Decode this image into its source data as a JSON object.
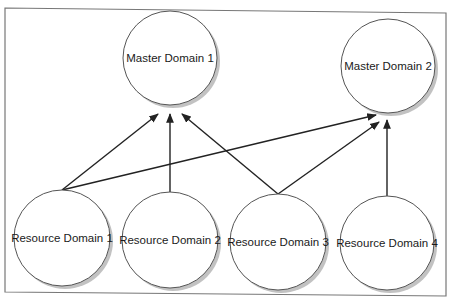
{
  "diagram": {
    "type": "domain-trust-hierarchy",
    "colors": {
      "frame": "#777777",
      "node_fill": "#ffffff",
      "node_stroke": "#555555",
      "node_shadow": "#9a9a9a",
      "edge": "#222222"
    },
    "nodes": [
      {
        "id": "md1",
        "label": "Master Domain 1",
        "tier": "master"
      },
      {
        "id": "md2",
        "label": "Master Domain 2",
        "tier": "master"
      },
      {
        "id": "rd1",
        "label": "Resource Domain 1",
        "tier": "resource"
      },
      {
        "id": "rd2",
        "label": "Resource Domain 2",
        "tier": "resource"
      },
      {
        "id": "rd3",
        "label": "Resource Domain 3",
        "tier": "resource"
      },
      {
        "id": "rd4",
        "label": "Resource Domain 4",
        "tier": "resource"
      }
    ],
    "edges": [
      {
        "from": "rd1",
        "to": "md1",
        "arrow": "end"
      },
      {
        "from": "rd1",
        "to": "md2",
        "arrow": "end"
      },
      {
        "from": "rd2",
        "to": "md1",
        "arrow": "end"
      },
      {
        "from": "rd3",
        "to": "md1",
        "arrow": "end"
      },
      {
        "from": "rd3",
        "to": "md2",
        "arrow": "end"
      },
      {
        "from": "rd4",
        "to": "md2",
        "arrow": "end"
      }
    ]
  }
}
